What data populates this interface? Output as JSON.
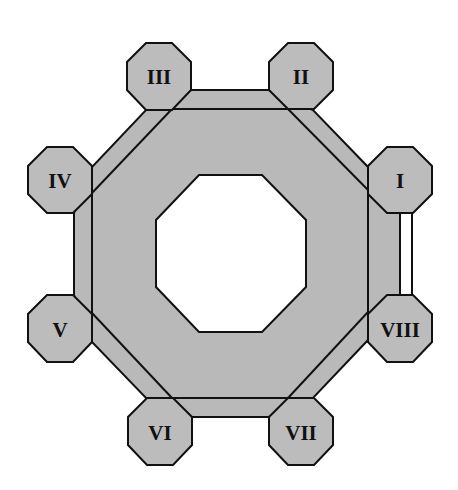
{
  "diagram": {
    "colors": {
      "fill": "#b9b9b9",
      "stroke": "#111111",
      "background": "#ffffff"
    },
    "nodes": [
      {
        "id": "I",
        "label": "I"
      },
      {
        "id": "II",
        "label": "II"
      },
      {
        "id": "III",
        "label": "III"
      },
      {
        "id": "IV",
        "label": "IV"
      },
      {
        "id": "V",
        "label": "V"
      },
      {
        "id": "VI",
        "label": "VI"
      },
      {
        "id": "VII",
        "label": "VII"
      },
      {
        "id": "VIII",
        "label": "VIII"
      }
    ],
    "connections": [
      {
        "from": "I",
        "to": "VIII",
        "style": "white-gap"
      }
    ]
  }
}
